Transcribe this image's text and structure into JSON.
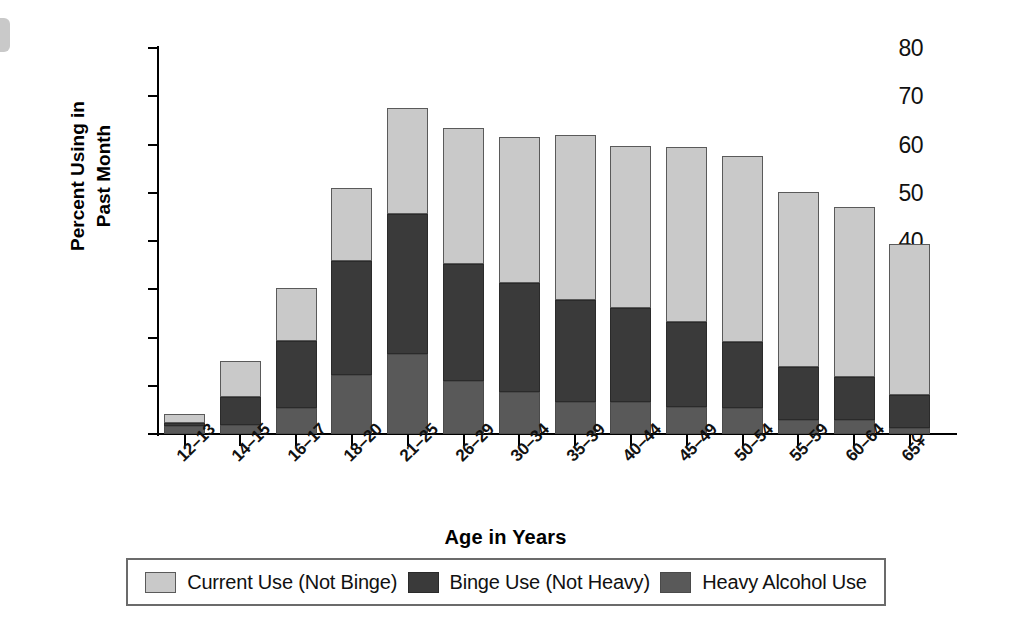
{
  "chart_data": {
    "type": "bar",
    "subtype": "stacked-bar",
    "title": "",
    "xlabel": "Age in Years",
    "ylabel": "Percent Using in\nPast Month",
    "ylim": [
      0,
      80
    ],
    "yticks": [
      0,
      10,
      20,
      30,
      40,
      50,
      60,
      70,
      80
    ],
    "ytick_labels": [
      "0",
      "10",
      "20",
      "30",
      "40",
      "50",
      "60",
      "70",
      "80"
    ],
    "grid": false,
    "legend_position": "bottom",
    "categories": [
      "12–13",
      "14–15",
      "16–17",
      "18–20",
      "21–25",
      "26–29",
      "30–34",
      "35–39",
      "40–44",
      "45–49",
      "50–54",
      "55–59",
      "60–64",
      "65+"
    ],
    "series": [
      {
        "name": "Heavy Alcohol Use",
        "color": "#595959",
        "values": [
          1.7,
          1.9,
          5.4,
          12.3,
          16.5,
          10.9,
          8.7,
          6.6,
          6.6,
          5.7,
          5.3,
          2.9,
          2.9,
          1.2
        ]
      },
      {
        "name": "Binge Use (Not Heavy)",
        "color": "#3a3a3a",
        "values": [
          0.6,
          5.8,
          13.9,
          23.5,
          29.2,
          24.3,
          22.6,
          21.2,
          19.6,
          17.6,
          13.7,
          10.9,
          9.0,
          6.8
        ]
      },
      {
        "name": "Current Use (Not Binge)",
        "color": "#c9c9c9",
        "values": [
          1.9,
          7.4,
          10.9,
          15.2,
          21.8,
          28.3,
          30.2,
          34.2,
          33.4,
          36.2,
          38.6,
          36.4,
          35.1,
          31.3
        ]
      }
    ],
    "totals": [
      4.2,
      15.1,
      30.2,
      51.0,
      67.5,
      63.5,
      61.5,
      62.0,
      59.6,
      59.5,
      57.6,
      50.2,
      47.0,
      39.3
    ]
  },
  "legend": {
    "entries": [
      {
        "label": "Current Use (Not Binge)",
        "key": "current"
      },
      {
        "label": "Binge Use (Not Heavy)",
        "key": "binge"
      },
      {
        "label": "Heavy Alcohol Use",
        "key": "heavy"
      }
    ]
  }
}
